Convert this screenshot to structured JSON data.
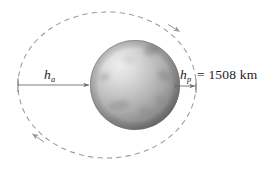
{
  "figure": {
    "type": "orbital-diagram",
    "caption_labels": {
      "apoapsis_symbol": "h",
      "apoapsis_subscript": "a",
      "periapsis_symbol": "h",
      "periapsis_subscript": "p",
      "periapsis_value": "= 1508 km"
    },
    "colors": {
      "orbit_stroke": "#9a9a9a",
      "arrow_stroke": "#6e6e6e",
      "text": "#1c1c1c",
      "planet_light": "#e2e2e2",
      "planet_mid": "#a8a8a8",
      "planet_dark": "#6f6f6f",
      "planet_patch": "#8a8a8a",
      "background": "#ffffff"
    },
    "geometry": {
      "orbit_center_x": 107,
      "orbit_center_y": 85,
      "orbit_radius_x": 89,
      "orbit_radius_y": 73,
      "planet_center_x": 135,
      "planet_center_y": 85,
      "planet_radius": 45,
      "apoapsis_arrow_x1": 18,
      "apoapsis_arrow_x2": 90,
      "apoapsis_arrow_y": 85,
      "periapsis_arrow_x1": 179,
      "periapsis_arrow_x2": 196,
      "periapsis_arrow_y": 86
    },
    "icons": {
      "orbit_direction_marker": "orbit-direction-arrow",
      "dimension_marker": "dimension-arrow"
    }
  }
}
